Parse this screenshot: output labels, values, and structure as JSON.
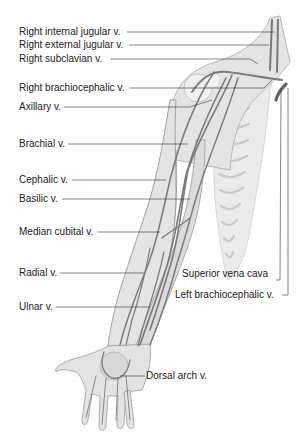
{
  "diagram": {
    "type": "anatomical-illustration",
    "colors": {
      "background": "#ffffff",
      "label_text": "#222222",
      "leader_line": "#333333",
      "skin_fill": "#e6e6e6",
      "skin_outline": "#9a9a9a",
      "vein": "#7a7a7a"
    },
    "labels_left": [
      {
        "id": "right-internal-jugular",
        "text": "Right internal jugular v."
      },
      {
        "id": "right-external-jugular",
        "text": "Right external jugular v."
      },
      {
        "id": "right-subclavian",
        "text": "Right subclavian v."
      },
      {
        "id": "right-brachiocephalic",
        "text": "Right brachiocephalic v."
      },
      {
        "id": "axillary",
        "text": "Axillary v."
      },
      {
        "id": "brachial",
        "text": "Brachial v."
      },
      {
        "id": "cephalic",
        "text": "Cephalic v."
      },
      {
        "id": "basilic",
        "text": "Basilic v."
      },
      {
        "id": "median-cubital",
        "text": "Median cubital v."
      },
      {
        "id": "radial",
        "text": "Radial v."
      },
      {
        "id": "ulnar",
        "text": "Ulnar v."
      }
    ],
    "labels_right": [
      {
        "id": "superior-vena-cava",
        "text": "Superior vena cava"
      },
      {
        "id": "left-brachiocephalic",
        "text": "Left brachiocephalic v."
      },
      {
        "id": "dorsal-arch",
        "text": "Dorsal arch v."
      }
    ]
  }
}
